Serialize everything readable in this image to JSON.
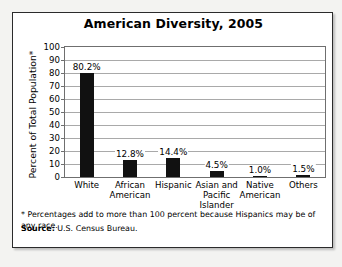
{
  "figure": {
    "title": "American Diversity, 2005",
    "footnote": "* Percentages add to more than 100 percent because Hispanics may be of any race.",
    "source_label": "Source:",
    "source_text": "U.S. Census Bureau."
  },
  "chart_data": {
    "type": "bar",
    "title": "American Diversity, 2005",
    "xlabel": "",
    "ylabel": "Percent of Total Population*",
    "ylim": [
      0,
      100
    ],
    "ytick_step": 10,
    "yticks": [
      0,
      10,
      20,
      30,
      40,
      50,
      60,
      70,
      80,
      90,
      100
    ],
    "grid": true,
    "legend": "none",
    "categories": [
      "White",
      "African American",
      "Hispanic",
      "Asian and Pacific Islander",
      "Native American",
      "Others"
    ],
    "values": [
      80.2,
      12.8,
      14.4,
      4.5,
      1.0,
      1.5
    ],
    "data_labels": [
      "80.2%",
      "12.8%",
      "14.4%",
      "4.5%",
      "1.0%",
      "1.5%"
    ],
    "bar_color": "#111111",
    "annotations": [
      "* Percentages add to more than 100 percent because Hispanics may be of any race."
    ]
  }
}
